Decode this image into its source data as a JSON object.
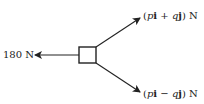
{
  "diagram": {
    "type": "force-diagram",
    "object": "particle (square)",
    "forces": [
      {
        "id": "left",
        "label": "180 N",
        "magnitude_text": "180",
        "unit": "N",
        "direction": "left"
      },
      {
        "id": "upper",
        "open": "(",
        "p": "p",
        "i": "i",
        "op": " + ",
        "q": "q",
        "j": "j",
        "close": ")",
        "unit": "N",
        "direction": "up-right"
      },
      {
        "id": "lower",
        "open": "(",
        "p": "p",
        "i": "i",
        "op": " − ",
        "q": "q",
        "j": "j",
        "close": ")",
        "unit": "N",
        "direction": "down-right"
      }
    ],
    "colors": {
      "stroke": "#222222",
      "background": "#ffffff"
    }
  }
}
